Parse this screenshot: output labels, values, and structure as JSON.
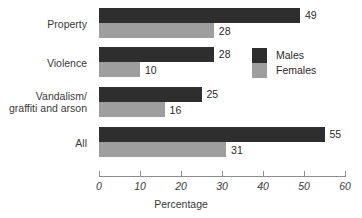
{
  "chart_data": {
    "type": "bar",
    "orientation": "horizontal",
    "title": "",
    "xlabel": "Percentage",
    "ylabel": "",
    "xlim": [
      0,
      60
    ],
    "xticks": [
      0,
      10,
      20,
      30,
      40,
      50,
      60
    ],
    "grid": false,
    "legend_position": "inside-top-right",
    "categories": [
      "Property",
      "Violence",
      "Vandalism/\ngraffiti and arson",
      "All"
    ],
    "series": [
      {
        "name": "Males",
        "color": "#2e2e2e",
        "values": [
          49,
          28,
          25,
          55
        ]
      },
      {
        "name": "Females",
        "color": "#9e9e9e",
        "values": [
          28,
          10,
          16,
          31
        ]
      }
    ],
    "data_labels": {
      "Property": {
        "Males": "49",
        "Females": "28"
      },
      "Violence": {
        "Males": "28",
        "Females": "10"
      },
      "Vandalism": {
        "Males": "25",
        "Females": "16"
      },
      "All": {
        "Males": "55",
        "Females": "31"
      }
    },
    "tick_labels": [
      "0",
      "10",
      "20",
      "30",
      "40",
      "50",
      "60"
    ]
  },
  "axis": {
    "title": "Percentage",
    "ticks": [
      "0",
      "10",
      "20",
      "30",
      "40",
      "50",
      "60"
    ]
  },
  "legend": {
    "items": [
      {
        "label": "Males"
      },
      {
        "label": "Females"
      }
    ]
  },
  "categories": [
    {
      "label": "Property"
    },
    {
      "label": "Violence"
    },
    {
      "label": "Vandalism/\ngraffiti and arson"
    },
    {
      "label": "All"
    }
  ]
}
